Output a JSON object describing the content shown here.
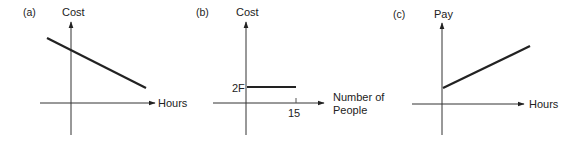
{
  "panels": [
    {
      "tag": "(a)",
      "y_label": "Cost",
      "x_label": "Hours",
      "description": "downward sloping line starting above origin on y-axis"
    },
    {
      "tag": "(b)",
      "y_label": "Cost",
      "x_label_line1": "Number of",
      "x_label_line2": "People",
      "y_tick": "2F",
      "x_tick": "15",
      "description": "horizontal line at 2F from 0 to 15"
    },
    {
      "tag": "(c)",
      "y_label": "Pay",
      "x_label": "Hours",
      "description": "upward sloping line starting above origin on y-axis"
    }
  ],
  "colors": {
    "ink": "#222222",
    "background": "#ffffff"
  }
}
